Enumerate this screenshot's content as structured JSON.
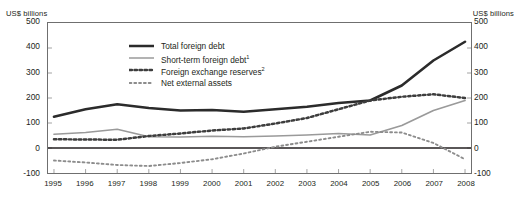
{
  "axis": {
    "unit_left": "US$ billions",
    "unit_right": "US$ billions"
  },
  "legend": {
    "items": [
      {
        "label": "Total foreign debt",
        "sup": "",
        "style": "solid-thick",
        "color": "#2b2b2b",
        "name": "legend-total-foreign-debt"
      },
      {
        "label": "Short-term foreign debt",
        "sup": "1",
        "style": "solid-thin",
        "color": "#9a9a9a",
        "name": "legend-short-term-foreign-debt"
      },
      {
        "label": "Foreign exchange reserves",
        "sup": "2",
        "style": "dotted-bold",
        "color": "#3d3d3d",
        "name": "legend-foreign-exchange-reserves"
      },
      {
        "label": "Net external assets",
        "sup": "",
        "style": "dotted-fine",
        "color": "#8c8c8c",
        "name": "legend-net-external-assets"
      }
    ]
  },
  "chart_data": {
    "type": "line",
    "title": "",
    "xlabel": "",
    "ylabel": "US$ billions",
    "ylim": [
      -100,
      500
    ],
    "yticks": [
      500,
      400,
      300,
      200,
      100,
      0,
      -100
    ],
    "grid": false,
    "legend_position": "inside-top-center",
    "categories": [
      1995,
      1996,
      1997,
      1998,
      1999,
      2000,
      2001,
      2002,
      2003,
      2004,
      2005,
      2006,
      2007,
      2008
    ],
    "x_tick_labels": [
      "1995",
      "1996",
      "1997",
      "1998",
      "1999",
      "2000",
      "2001",
      "2002",
      "2003",
      "2004",
      "2005",
      "2006",
      "2007",
      "2008"
    ],
    "series": [
      {
        "name": "Total foreign debt",
        "color": "#2b2b2b",
        "style": "solid-thick",
        "values": [
          125,
          155,
          175,
          160,
          150,
          152,
          145,
          155,
          165,
          180,
          190,
          250,
          350,
          425
        ]
      },
      {
        "name": "Short-term foreign debt",
        "color": "#9a9a9a",
        "style": "solid-thin",
        "values": [
          55,
          62,
          75,
          45,
          44,
          47,
          45,
          48,
          52,
          58,
          52,
          90,
          150,
          190
        ]
      },
      {
        "name": "Foreign exchange reserves",
        "color": "#3d3d3d",
        "style": "dotted-bold",
        "values": [
          35,
          34,
          33,
          48,
          58,
          70,
          78,
          98,
          120,
          155,
          190,
          205,
          215,
          200
        ]
      },
      {
        "name": "Net external assets",
        "color": "#8c8c8c",
        "style": "dotted-fine",
        "values": [
          -50,
          -58,
          -68,
          -72,
          -60,
          -45,
          -22,
          5,
          25,
          45,
          65,
          62,
          20,
          -45
        ]
      }
    ]
  }
}
